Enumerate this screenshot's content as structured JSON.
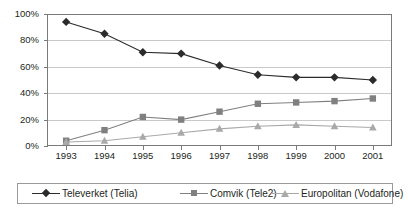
{
  "chart_data": {
    "type": "line",
    "title": "",
    "xlabel": "",
    "ylabel": "",
    "categories": [
      "1993",
      "1994",
      "1995",
      "1996",
      "1997",
      "1998",
      "1999",
      "2000",
      "2001"
    ],
    "ylim": [
      0,
      100
    ],
    "yticks": [
      "0%",
      "20%",
      "40%",
      "60%",
      "80%",
      "100%"
    ],
    "ytick_values": [
      0,
      20,
      40,
      60,
      80,
      100
    ],
    "grid": true,
    "legend_position": "bottom",
    "series": [
      {
        "name": "Televerket (Telia)",
        "marker": "diamond",
        "color": "#2b2b2b",
        "values": [
          94,
          85,
          71,
          70,
          61,
          54,
          52,
          52,
          50
        ]
      },
      {
        "name": "Comvik (Tele2)",
        "marker": "square",
        "color": "#808080",
        "values": [
          4,
          12,
          22,
          20,
          26,
          32,
          33,
          34,
          36
        ]
      },
      {
        "name": "Europolitan (Vodafone)",
        "marker": "triangle",
        "color": "#a9a9a9",
        "values": [
          3,
          4,
          7,
          10,
          13,
          15,
          16,
          15,
          14
        ]
      }
    ]
  }
}
